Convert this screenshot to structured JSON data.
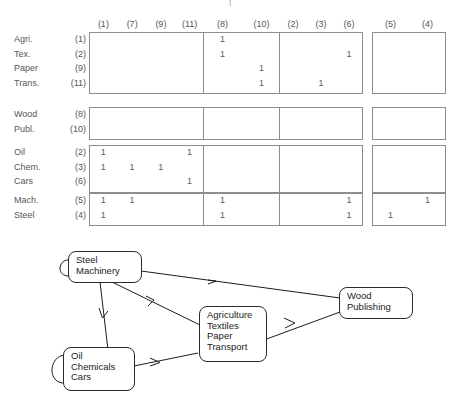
{
  "matrix": {
    "column_groups": [
      {
        "name": "group-a",
        "columns": [
          "(1)",
          "(7)",
          "(9)",
          "(11)"
        ]
      },
      {
        "name": "group-b",
        "columns": [
          "(8)",
          "(10)"
        ]
      },
      {
        "name": "group-c",
        "columns": [
          "(2)",
          "(3)",
          "(6)"
        ]
      },
      {
        "name": "group-d",
        "columns": [
          "(5)",
          "(4)"
        ]
      }
    ],
    "row_groups": [
      {
        "name": "group-agri",
        "rows": [
          {
            "label": "Agri.",
            "index": "(1)"
          },
          {
            "label": "Tex.",
            "index": "(2)"
          },
          {
            "label": "Paper",
            "index": "(9)"
          },
          {
            "label": "Trans.",
            "index": "(11)"
          }
        ]
      },
      {
        "name": "group-wood",
        "rows": [
          {
            "label": "Wood",
            "index": "(8)"
          },
          {
            "label": "Publ.",
            "index": "(10)"
          }
        ]
      },
      {
        "name": "group-oil",
        "rows": [
          {
            "label": "Oil",
            "index": "(2)"
          },
          {
            "label": "Chem.",
            "index": "(3)"
          },
          {
            "label": "Cars",
            "index": "(6)"
          }
        ]
      },
      {
        "name": "group-mach",
        "rows": [
          {
            "label": "Mach.",
            "index": "(5)"
          },
          {
            "label": "Steel",
            "index": "(4)"
          }
        ]
      }
    ],
    "entry_value": "1",
    "entries": [
      {
        "rg": 0,
        "r": 0,
        "cg": 1,
        "c": 0
      },
      {
        "rg": 0,
        "r": 1,
        "cg": 1,
        "c": 0
      },
      {
        "rg": 0,
        "r": 1,
        "cg": 2,
        "c": 2
      },
      {
        "rg": 0,
        "r": 2,
        "cg": 1,
        "c": 1
      },
      {
        "rg": 0,
        "r": 3,
        "cg": 1,
        "c": 1
      },
      {
        "rg": 0,
        "r": 3,
        "cg": 2,
        "c": 1
      },
      {
        "rg": 2,
        "r": 0,
        "cg": 0,
        "c": 0
      },
      {
        "rg": 2,
        "r": 0,
        "cg": 0,
        "c": 3
      },
      {
        "rg": 2,
        "r": 1,
        "cg": 0,
        "c": 0
      },
      {
        "rg": 2,
        "r": 1,
        "cg": 0,
        "c": 1
      },
      {
        "rg": 2,
        "r": 1,
        "cg": 0,
        "c": 2
      },
      {
        "rg": 2,
        "r": 2,
        "cg": 0,
        "c": 3
      },
      {
        "rg": 3,
        "r": 0,
        "cg": 0,
        "c": 0
      },
      {
        "rg": 3,
        "r": 0,
        "cg": 0,
        "c": 1
      },
      {
        "rg": 3,
        "r": 0,
        "cg": 1,
        "c": 0
      },
      {
        "rg": 3,
        "r": 0,
        "cg": 2,
        "c": 2
      },
      {
        "rg": 3,
        "r": 0,
        "cg": 3,
        "c": 1
      },
      {
        "rg": 3,
        "r": 1,
        "cg": 0,
        "c": 0
      },
      {
        "rg": 3,
        "r": 1,
        "cg": 1,
        "c": 0
      },
      {
        "rg": 3,
        "r": 1,
        "cg": 2,
        "c": 2
      },
      {
        "rg": 3,
        "r": 1,
        "cg": 3,
        "c": 0
      }
    ]
  },
  "diagram": {
    "nodes": [
      {
        "id": "steel",
        "lines": [
          "Steel",
          "Machinery"
        ]
      },
      {
        "id": "oil",
        "lines": [
          "Oil",
          "Chemicals",
          "Cars"
        ]
      },
      {
        "id": "agri",
        "lines": [
          "Agriculture",
          "Textiles",
          "Paper",
          "Transport"
        ]
      },
      {
        "id": "wood",
        "lines": [
          "Wood",
          "Publishing"
        ]
      }
    ],
    "edges": [
      {
        "from": "steel",
        "to": "steel"
      },
      {
        "from": "steel",
        "to": "wood"
      },
      {
        "from": "steel",
        "to": "agri"
      },
      {
        "from": "steel",
        "to": "oil"
      },
      {
        "from": "oil",
        "to": "oil"
      },
      {
        "from": "oil",
        "to": "agri"
      },
      {
        "from": "agri",
        "to": "wood"
      }
    ]
  }
}
